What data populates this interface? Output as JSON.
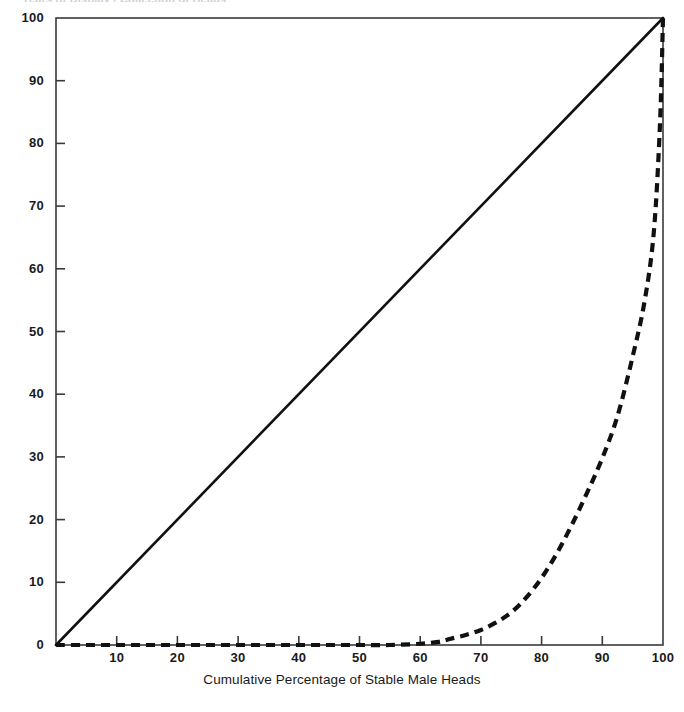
{
  "figure": {
    "top_clipped_text": "Years of Display / Collection of Heads",
    "background": "#ffffff",
    "ink_color": "#111111"
  },
  "axes": {
    "x_title": "Cumulative Percentage of Stable Male Heads",
    "y_title": "",
    "x_ticks": [
      "10",
      "20",
      "30",
      "40",
      "50",
      "60",
      "70",
      "80",
      "90",
      "100"
    ],
    "y_ticks": [
      "0",
      "10",
      "20",
      "30",
      "40",
      "50",
      "60",
      "70",
      "80",
      "90",
      "100"
    ],
    "x_range": [
      0,
      100
    ],
    "y_range": [
      0,
      100
    ],
    "grid": false
  },
  "chart_data": {
    "type": "line",
    "title": "",
    "subtitle": "",
    "xlabel": "Cumulative Percentage of Stable Male Heads",
    "ylabel": "",
    "xlim": [
      0,
      100
    ],
    "ylim": [
      0,
      100
    ],
    "xticks": [
      0,
      10,
      20,
      30,
      40,
      50,
      60,
      70,
      80,
      90,
      100
    ],
    "yticks": [
      0,
      10,
      20,
      30,
      40,
      50,
      60,
      70,
      80,
      90,
      100
    ],
    "grid": false,
    "legend": "none",
    "legend_position": "none",
    "series": [
      {
        "name": "Line of equality",
        "style": "solid",
        "color": "#111111",
        "width": 2.6,
        "x": [
          0,
          100
        ],
        "y": [
          0,
          100
        ]
      },
      {
        "name": "Lorenz curve",
        "style": "dashed",
        "color": "#111111",
        "width": 4.2,
        "x": [
          0,
          5,
          10,
          15,
          20,
          25,
          30,
          35,
          40,
          45,
          50,
          55,
          60,
          63,
          65,
          67.5,
          70,
          72.5,
          75,
          77.5,
          80,
          82.5,
          85,
          87.5,
          90,
          92.5,
          95,
          97,
          98.5,
          99.5,
          100
        ],
        "y": [
          0,
          0,
          0,
          0,
          0,
          0,
          0,
          0,
          0,
          0,
          0,
          0,
          0.2,
          0.5,
          1.0,
          1.6,
          2.4,
          3.6,
          5.2,
          7.6,
          10.7,
          14.6,
          19.2,
          24.3,
          29.8,
          36.5,
          46.0,
          55.0,
          66.0,
          83.0,
          100
        ]
      }
    ],
    "annotations": []
  }
}
